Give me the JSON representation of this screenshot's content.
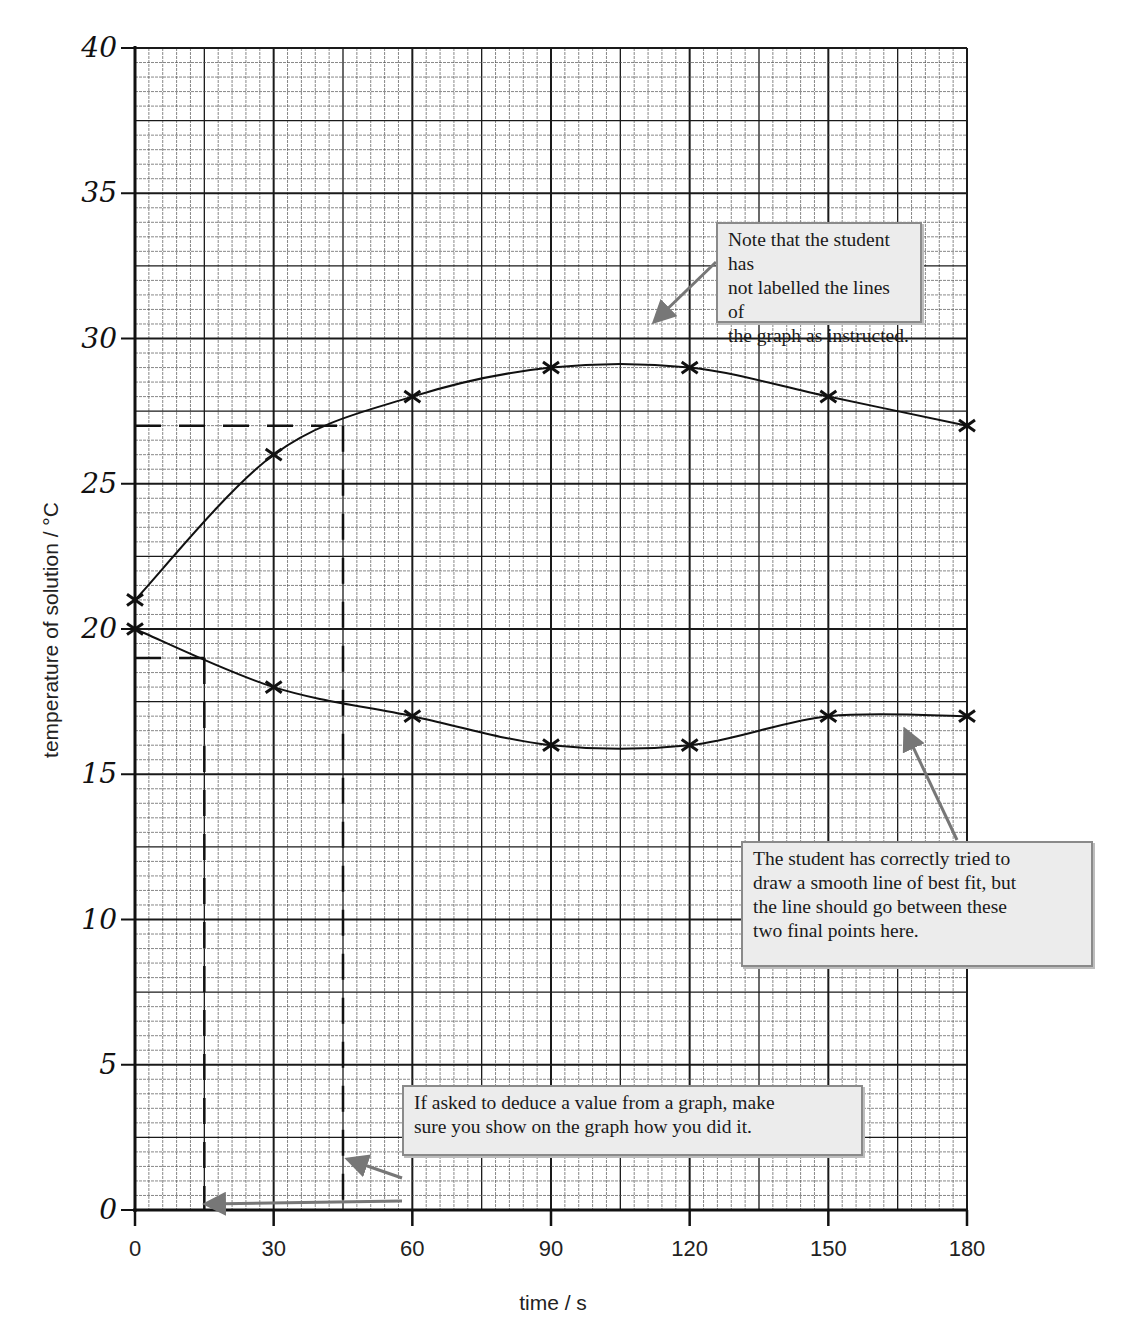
{
  "chart_data": {
    "type": "line",
    "title": "",
    "xlabel": "time / s",
    "ylabel": "temperature of solution / °C",
    "xlim": [
      0,
      180
    ],
    "ylim": [
      0,
      40
    ],
    "x_ticks": [
      0,
      30,
      60,
      90,
      120,
      150,
      180
    ],
    "x_tick_labels": [
      "0",
      "30",
      "60",
      "90",
      "120",
      "150",
      "180"
    ],
    "y_ticks": [
      0,
      5,
      10,
      15,
      20,
      25,
      30,
      35,
      40
    ],
    "y_tick_labels": [
      "0",
      "5",
      "10",
      "15",
      "20",
      "25",
      "30",
      "35",
      "40"
    ],
    "grid": true,
    "legend": null,
    "x": [
      0,
      30,
      60,
      90,
      120,
      150,
      180
    ],
    "series": [
      {
        "name": "upper line (unlabelled)",
        "values": [
          21,
          26,
          28,
          29,
          29,
          28,
          27
        ],
        "marker": "x"
      },
      {
        "name": "lower line (unlabelled)",
        "values": [
          20,
          18,
          17,
          16,
          16,
          17,
          17
        ],
        "marker": "x"
      }
    ],
    "construction_lines": [
      {
        "series": "upper line (unlabelled)",
        "y": 27,
        "x": 45,
        "style": "dashed"
      },
      {
        "series": "lower line (unlabelled)",
        "y": 19,
        "x": 15,
        "style": "dashed"
      }
    ],
    "annotations": [
      "Note that the student has not labelled the lines of the graph as instructed.",
      "The student has correctly tried to draw a smooth line of best fit, but the line should go between these two final points here.",
      "If asked to deduce a value from a graph, make sure you show on the graph how you did it."
    ]
  },
  "axes": {
    "x_title": "time / s",
    "y_title": "temperature of solution / °C"
  },
  "notes": {
    "labels_note": "Note that the student has\nnot labelled the lines of\nthe graph as instructed.",
    "best_fit_note": "The student has correctly tried to\ndraw a smooth line of best fit, but\nthe line should go between these\ntwo final points here.",
    "deduce_note": "If asked to deduce a value from a graph, make\nsure you show on the graph how you did it."
  },
  "colors": {
    "grid_major": "#1a1a1a",
    "grid_minor": "#555555",
    "ink": "#111111",
    "arrow": "#777777",
    "note_bg": "#ececec",
    "note_border": "#8a8a8a"
  }
}
